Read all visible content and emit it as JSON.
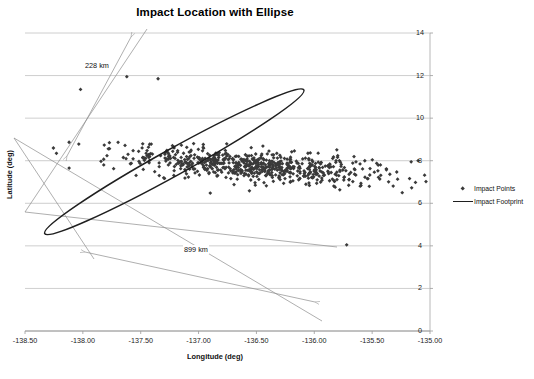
{
  "chart_data": {
    "type": "scatter",
    "title": "Impact Location with Ellipse",
    "xlabel": "Longitude (deg)",
    "ylabel": "Latitude (deg)",
    "xlim": [
      -138.5,
      -135.0
    ],
    "ylim": [
      0,
      14
    ],
    "grid": "horizontal",
    "legend_position": "right",
    "xticks": [
      "-138.50",
      "-138.00",
      "-137.50",
      "-137.00",
      "-136.50",
      "-136.00",
      "-135.50",
      "-135.00"
    ],
    "xtick_values": [
      -138.5,
      -138.0,
      -137.5,
      -137.0,
      -136.5,
      -136.0,
      -135.5,
      -135.0
    ],
    "yticks": [
      "0",
      "2",
      "4",
      "6",
      "8",
      "10",
      "12",
      "14"
    ],
    "ytick_values": [
      0,
      2,
      4,
      6,
      8,
      10,
      12,
      14
    ],
    "y_axis_side": "right",
    "series": [
      {
        "name": "Impact Points",
        "type": "scatter",
        "marker": "diamond",
        "color": "#3a3a3a",
        "n_points": 700,
        "cluster": {
          "center_x": -136.55,
          "center_y": 7.8,
          "spread_major": 0.62,
          "spread_minor": 0.3,
          "rotation_deg": -29
        },
        "outliers": [
          {
            "x": -138.02,
            "y": 11.35
          },
          {
            "x": -137.62,
            "y": 11.95
          },
          {
            "x": -137.35,
            "y": 11.85
          },
          {
            "x": -135.72,
            "y": 4.05
          }
        ]
      },
      {
        "name": "Impact Footprint",
        "type": "ellipse",
        "color": "#1f1f1f",
        "center_x": -137.21,
        "center_y": 7.95,
        "semi_major_deg": 1.28,
        "semi_minor_deg": 0.62,
        "rotation_deg": -29
      }
    ],
    "annotations": [
      {
        "label": "228 km",
        "kind": "dimension",
        "axis": "minor"
      },
      {
        "label": "899 km",
        "kind": "dimension",
        "axis": "major"
      }
    ]
  },
  "legend": {
    "items": [
      {
        "label": "Impact Points",
        "key": "diamond"
      },
      {
        "label": "Impact Footprint",
        "key": "line"
      }
    ]
  }
}
